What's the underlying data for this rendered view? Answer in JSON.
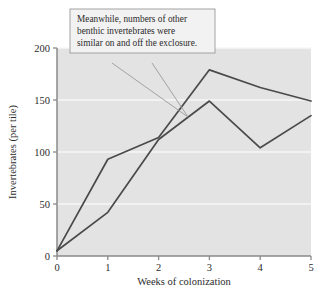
{
  "chart_data": {
    "type": "line",
    "title": "",
    "xlabel": "Weeks of colonization",
    "ylabel": "Invertebrates (per tile)",
    "x": [
      0,
      1,
      2,
      3,
      4,
      5
    ],
    "xlim": [
      0,
      5
    ],
    "ylim": [
      0,
      200
    ],
    "xticks": [
      "0",
      "1",
      "2",
      "3",
      "4",
      "5"
    ],
    "yticks": [
      "0",
      "50",
      "100",
      "150",
      "200"
    ],
    "grid": "horizontal-white-gridlines",
    "legend": "none",
    "series": [
      {
        "name": "On exclosure",
        "values": [
          5,
          93,
          114,
          179,
          162,
          149
        ],
        "color": "#4a4a4a"
      },
      {
        "name": "Off exclosure",
        "values": [
          5,
          42,
          112,
          149,
          104,
          135
        ],
        "color": "#4a4a4a"
      }
    ],
    "annotations": [
      {
        "name": "callout",
        "lines": [
          "Meanwhile, numbers of other",
          "benthic invertebrates were",
          "similar on and off the exclosure."
        ],
        "points_to_x": 2.55,
        "points_to_y": 143
      }
    ],
    "colors": {
      "plot_background": "#e3e3e3",
      "gridline": "#f7f7f7",
      "axis": "#8a8a8a",
      "line": "#4a4a4a",
      "leader": "#9a9a9a",
      "callout_border": "#9a9a9a",
      "callout_background": "#f2f2f2",
      "page_background": "#ffffff"
    }
  }
}
